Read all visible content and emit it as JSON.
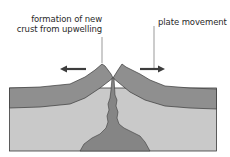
{
  "labels": {
    "upwelling_line1": "formation of new",
    "upwelling_line2": "crust from upwelling",
    "plate_movement": "plate movement"
  },
  "colors": {
    "background": "#ffffff",
    "crust": "#8f8f8f",
    "mantle": "#c9c9c9",
    "magma": "#858585",
    "outline": "#3a3a3a",
    "arrow": "#3d3d3d",
    "leader_line": "#555555",
    "text": "#2a2a2a"
  },
  "arrows": [
    {
      "name": "left-plate-movement-arrow",
      "direction": "left"
    },
    {
      "name": "right-plate-movement-arrow",
      "direction": "right"
    }
  ]
}
